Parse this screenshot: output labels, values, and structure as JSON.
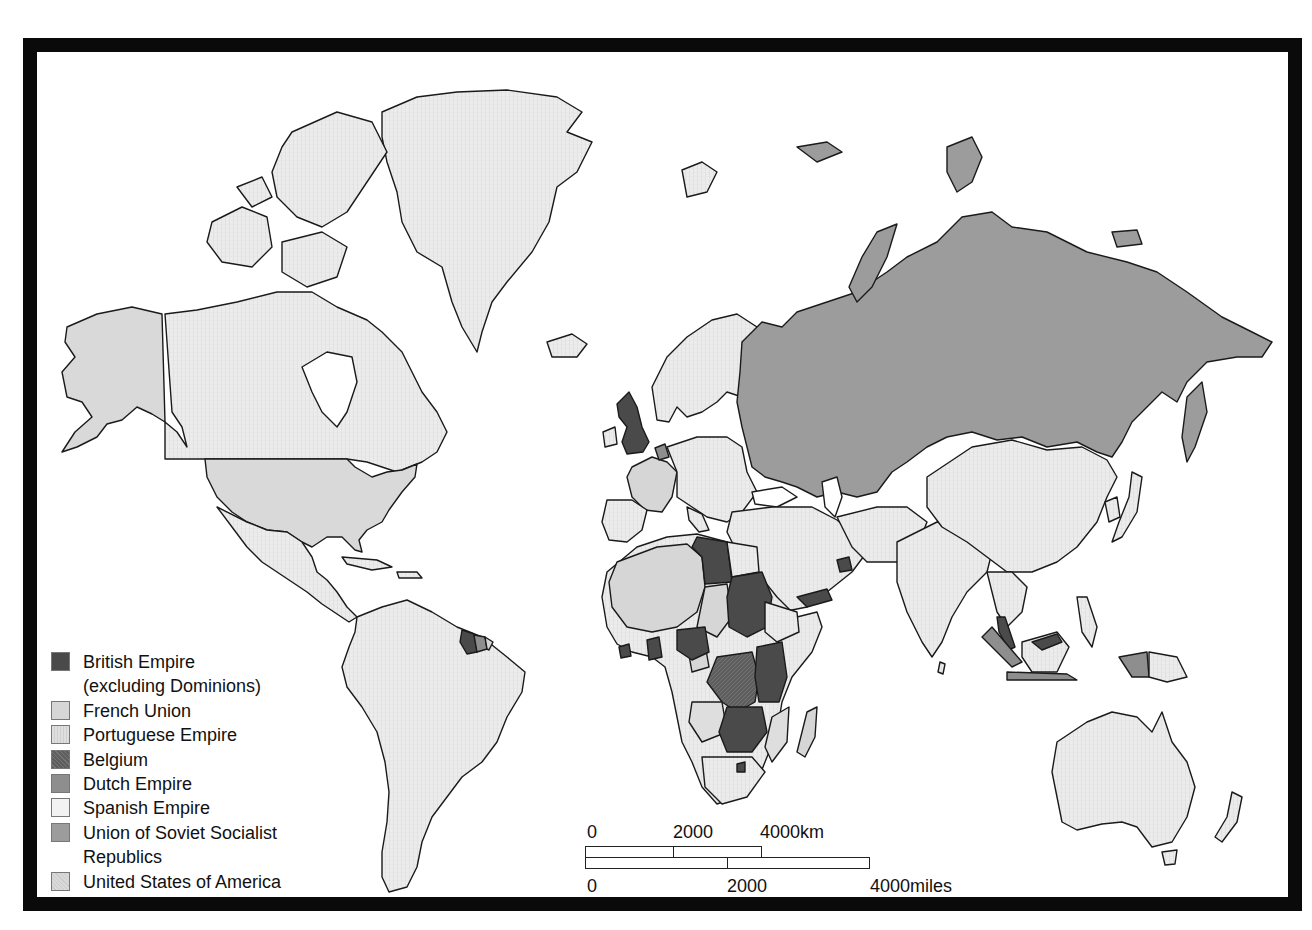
{
  "map": {
    "title": "World map of colonial empires and major powers",
    "colors": {
      "british": "#4a4a4a",
      "french": "#d6d6d6",
      "portuguese": "#dedede",
      "belgium": "#5e5e5e",
      "dutch": "#8e8e8e",
      "spanish": "#f2f2f2",
      "ussr": "#9c9c9c",
      "usa": "#d9d9d9",
      "other": "#ececec",
      "water": "#ffffff",
      "frame": "#0a0a0a"
    }
  },
  "legend": {
    "items": [
      {
        "key": "british",
        "label": "British Empire",
        "label_cont": "(excluding Dominions)",
        "color": "#4a4a4a"
      },
      {
        "key": "french",
        "label": "French Union",
        "color": "#d6d6d6"
      },
      {
        "key": "portuguese",
        "label": "Portuguese Empire",
        "color": "#dedede"
      },
      {
        "key": "belgium",
        "label": "Belgium",
        "color": "#5e5e5e"
      },
      {
        "key": "dutch",
        "label": "Dutch Empire",
        "color": "#8e8e8e"
      },
      {
        "key": "spanish",
        "label": "Spanish Empire",
        "color": "#f2f2f2"
      },
      {
        "key": "ussr",
        "label": "Union of Soviet Socialist",
        "label_cont": "Republics",
        "color": "#9c9c9c"
      },
      {
        "key": "usa",
        "label": "United States of America",
        "color": "#d9d9d9"
      }
    ]
  },
  "scale": {
    "km": {
      "ticks": [
        "0",
        "2000",
        "4000km"
      ]
    },
    "miles": {
      "ticks": [
        "0",
        "2000",
        "4000miles"
      ]
    }
  }
}
